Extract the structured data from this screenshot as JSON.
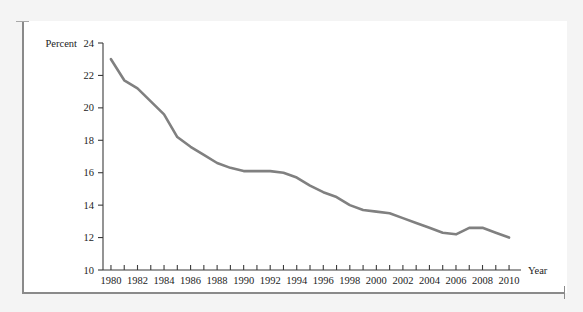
{
  "chart_data": {
    "type": "line",
    "title": "",
    "xlabel": "Year",
    "ylabel": "Percent",
    "xlim": [
      1979.4,
      2010.9
    ],
    "ylim": [
      10,
      24
    ],
    "grid": false,
    "legend": "none",
    "line_color": "#808080",
    "axis_color": "#3b3b3b",
    "x_tick_labels": [
      "1980",
      "1982",
      "1984",
      "1986",
      "1988",
      "1990",
      "1992",
      "1994",
      "1996",
      "1998",
      "2000",
      "2002",
      "2004",
      "2006",
      "2008",
      "2010"
    ],
    "x_tick_values": [
      1980,
      1982,
      1984,
      1986,
      1988,
      1990,
      1992,
      1994,
      1996,
      1998,
      2000,
      2002,
      2004,
      2006,
      2008,
      2010
    ],
    "x_minor_ticks": [
      1980,
      1981,
      1982,
      1983,
      1984,
      1985,
      1986,
      1987,
      1988,
      1989,
      1990,
      1991,
      1992,
      1993,
      1994,
      1995,
      1996,
      1997,
      1998,
      1999,
      2000,
      2001,
      2002,
      2003,
      2004,
      2005,
      2006,
      2007,
      2008,
      2009,
      2010
    ],
    "y_tick_labels": [
      "10",
      "12",
      "14",
      "16",
      "18",
      "20",
      "22",
      "24"
    ],
    "y_tick_values": [
      10,
      12,
      14,
      16,
      18,
      20,
      22,
      24
    ],
    "y_axis_title_inline": "Percent",
    "x": [
      1980,
      1981,
      1982,
      1983,
      1984,
      1985,
      1986,
      1987,
      1988,
      1989,
      1990,
      1991,
      1992,
      1993,
      1994,
      1995,
      1996,
      1997,
      1998,
      1999,
      2000,
      2001,
      2002,
      2003,
      2004,
      2005,
      2006,
      2007,
      2008,
      2009,
      2010
    ],
    "values": [
      23.0,
      21.7,
      21.2,
      20.4,
      19.6,
      18.2,
      17.6,
      17.1,
      16.6,
      16.3,
      16.1,
      16.1,
      16.1,
      16.0,
      15.7,
      15.2,
      14.8,
      14.5,
      14.0,
      13.7,
      13.6,
      13.5,
      13.2,
      12.9,
      12.6,
      12.3,
      12.2,
      12.6,
      12.6,
      12.3,
      12.0
    ]
  }
}
